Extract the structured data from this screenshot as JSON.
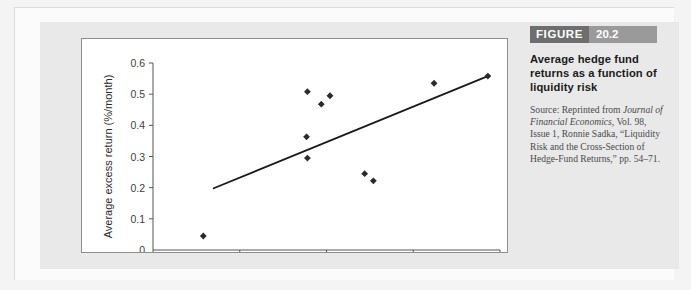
{
  "figure": {
    "label_word": "FIGURE",
    "number": "20.2",
    "title": "Average hedge fund returns as a function of liquidity risk",
    "source_lines": [
      "Source: Reprinted from",
      "Journal of Financial",
      "Economics, Vol. 98, Issue 1,",
      "Ronnie Sadka, “Liquidity",
      "Risk and the Cross-Section",
      "of Hedge-Fund Returns,”",
      "pp. 54–71."
    ],
    "source_prefix": "Source: Reprinted from",
    "source_journal_italic": "Journal of Financial Economics,",
    "source_rest": " Vol. 98, Issue 1, Ronnie Sadka, “Liquidity Risk and the Cross-Section of Hedge-Fund Returns,” pp. 54–71.",
    "header_dark_color": "#6e6e6e",
    "header_light_color": "#9a9a9a"
  },
  "chart_data": {
    "type": "scatter",
    "title": "",
    "xlabel": "Liquidity beta",
    "ylabel": "Average excess return (%/month)",
    "xlim": [
      -0.5,
      1.5
    ],
    "ylim": [
      0,
      0.6
    ],
    "xticks": [
      -0.5,
      0,
      0.5,
      1,
      1.5
    ],
    "xticklabels": [
      "−0.5",
      "0",
      "0.5",
      "1",
      "1.5"
    ],
    "yticks": [
      0,
      0.1,
      0.2,
      0.3,
      0.4,
      0.5,
      0.6
    ],
    "yticklabels": [
      "0",
      "0.1",
      "0.2",
      "0.3",
      "0.4",
      "0.5",
      "0.6"
    ],
    "grid": false,
    "legend": false,
    "marker": "diamond",
    "marker_color": "#2b2b2b",
    "line_color": "#1a1a1a",
    "points": [
      {
        "x": -0.21,
        "y": 0.045
      },
      {
        "x": 0.385,
        "y": 0.363
      },
      {
        "x": 0.39,
        "y": 0.295
      },
      {
        "x": 0.39,
        "y": 0.508
      },
      {
        "x": 0.47,
        "y": 0.468
      },
      {
        "x": 0.52,
        "y": 0.495
      },
      {
        "x": 0.72,
        "y": 0.245
      },
      {
        "x": 0.77,
        "y": 0.222
      },
      {
        "x": 1.12,
        "y": 0.535
      },
      {
        "x": 1.43,
        "y": 0.558
      }
    ],
    "trendline": {
      "x0": -0.15,
      "y0": 0.198,
      "x1": 1.43,
      "y1": 0.558
    }
  },
  "watermark": {
    "left": "",
    "right": ""
  }
}
